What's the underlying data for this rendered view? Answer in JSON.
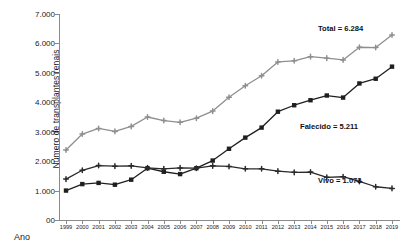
{
  "axes": {
    "y_title": "Número de transplantes renais",
    "x_title": "Ano",
    "y_ticks": [
      "00",
      "1.000",
      "2.000",
      "3.000",
      "4.000",
      "5.000",
      "6.000",
      "7.000"
    ]
  },
  "annotations": {
    "total": "Total = 6.284",
    "falecido": "Falecido = 5.211",
    "vivo": "Vivo = 1.073"
  },
  "chart_data": {
    "type": "line",
    "title": "",
    "xlabel": "Ano",
    "ylabel": "Número de transplantes renais",
    "ylim": [
      0,
      7000
    ],
    "ytick_values": [
      0,
      1000,
      2000,
      3000,
      4000,
      5000,
      6000,
      7000
    ],
    "ytick_labels": [
      "00",
      "1.000",
      "2.000",
      "3.000",
      "4.000",
      "5.000",
      "6.000",
      "7.000"
    ],
    "grid": false,
    "legend": "inline-end-labels",
    "categories": [
      "1999",
      "2000",
      "2001",
      "2002",
      "2003",
      "2004",
      "2005",
      "2006",
      "2007",
      "2008",
      "2009",
      "2010",
      "2011",
      "2012",
      "2013",
      "2014",
      "2015",
      "2016",
      "2017",
      "2018",
      "2019"
    ],
    "series": [
      {
        "name": "Total",
        "color": "#8f8f8f",
        "marker": "cross",
        "end_label": "Total = 6.284",
        "values": [
          2380,
          2920,
          3110,
          3010,
          3180,
          3500,
          3380,
          3320,
          3460,
          3700,
          4170,
          4560,
          4900,
          5370,
          5410,
          5550,
          5500,
          5440,
          5870,
          5860,
          6284
        ]
      },
      {
        "name": "Falecido",
        "color": "#1f1f1f",
        "marker": "square",
        "end_label": "Falecido = 5.211",
        "values": [
          1000,
          1220,
          1260,
          1200,
          1370,
          1760,
          1640,
          1560,
          1760,
          2020,
          2420,
          2800,
          3140,
          3680,
          3900,
          4070,
          4230,
          4160,
          4640,
          4800,
          5211
        ]
      },
      {
        "name": "Vivo",
        "color": "#2a2a2a",
        "marker": "cross",
        "end_label": "Vivo = 1.073",
        "values": [
          1390,
          1690,
          1850,
          1830,
          1840,
          1770,
          1740,
          1770,
          1760,
          1840,
          1820,
          1740,
          1740,
          1660,
          1620,
          1630,
          1450,
          1470,
          1310,
          1130,
          1073
        ]
      }
    ]
  }
}
